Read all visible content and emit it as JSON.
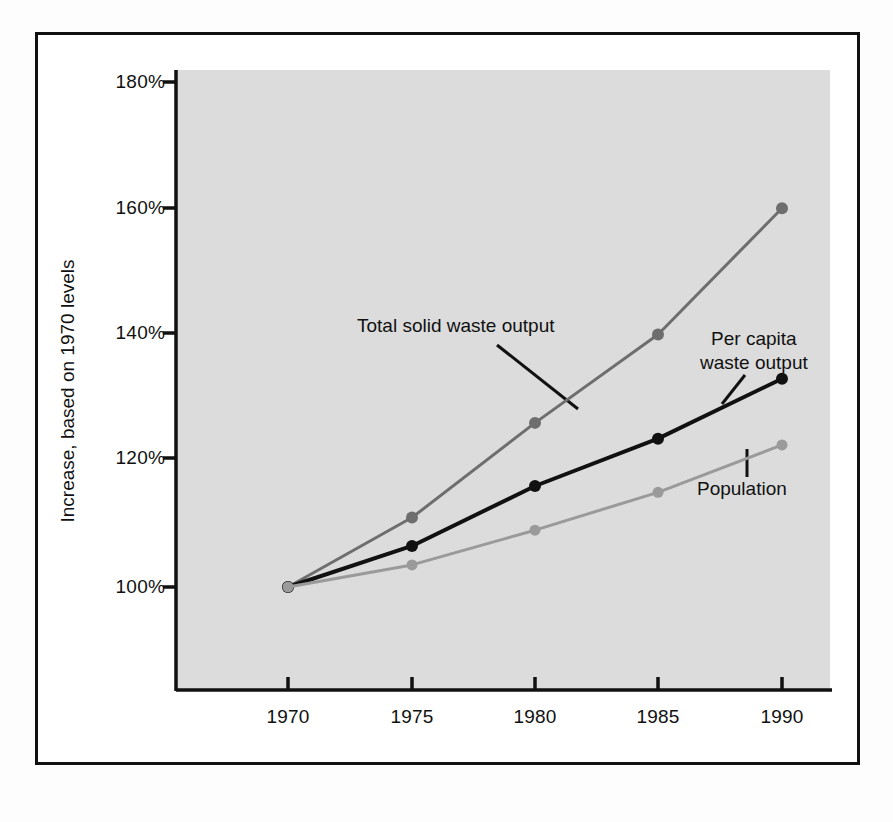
{
  "chart_data": {
    "type": "line",
    "title": "",
    "subtitle": "",
    "xlabel": "",
    "ylabel": "Increase, based on 1970 levels",
    "x": [
      1970,
      1975,
      1980,
      1985,
      1990
    ],
    "categories": [
      "1970",
      "1975",
      "1980",
      "1985",
      "1990"
    ],
    "xtick_labels": [
      "1970",
      "1975",
      "1980",
      "1985",
      "1990"
    ],
    "ytick_labels": [
      "100%",
      "120%",
      "140%",
      "160%",
      "180%"
    ],
    "ytick_values": [
      100,
      120,
      140,
      160,
      180
    ],
    "xlim": [
      1968.3,
      1991.5
    ],
    "ylim": [
      88,
      182
    ],
    "grid": false,
    "legend": "annotations-inline",
    "series": [
      {
        "name": "Total solid waste output",
        "color": "#6e6e6e",
        "marker": "circle",
        "marker_size": 9,
        "line_width": 3,
        "values": [
          100,
          111,
          126,
          140,
          160
        ]
      },
      {
        "name": "Per capita waste output",
        "color": "#111111",
        "marker": "circle",
        "marker_size": 9,
        "line_width": 4,
        "values": [
          100,
          106.5,
          116,
          123.5,
          133
        ]
      },
      {
        "name": "Population",
        "color": "#9a9a9a",
        "marker": "circle",
        "marker_size": 8,
        "line_width": 3,
        "values": [
          100,
          103.5,
          109,
          115,
          122.5
        ]
      }
    ],
    "annotations": [
      {
        "text": "Total solid waste output",
        "target_series": "Total solid waste output"
      },
      {
        "text_line_1": "Per capita",
        "text_line_2": "waste output",
        "target_series": "Per capita waste output"
      },
      {
        "text": "Population",
        "target_series": "Population"
      }
    ]
  },
  "axis": {
    "y_title": "Increase, based on 1970 levels",
    "y_ticks": [
      "180%",
      "160%",
      "140%",
      "120%",
      "100%"
    ],
    "x_ticks": [
      "1970",
      "1975",
      "1980",
      "1985",
      "1990"
    ]
  },
  "labels": {
    "total_waste": "Total solid waste output",
    "per_capita_line1": "Per capita",
    "per_capita_line2": "waste output",
    "population": "Population"
  },
  "colors": {
    "page_background": "#fdfdfd",
    "frame": "#111111",
    "plot_background": "#dcdcdc",
    "total_waste": "#6e6e6e",
    "per_capita": "#111111",
    "population": "#9a9a9a",
    "text": "#111111"
  }
}
